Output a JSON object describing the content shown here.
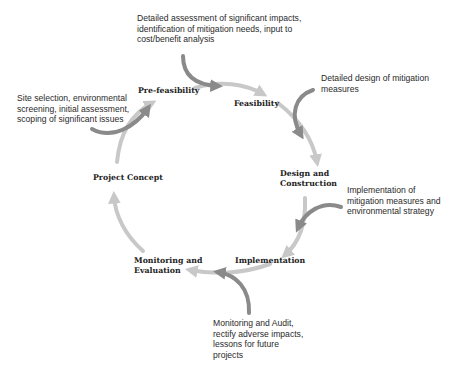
{
  "diagram": {
    "type": "project-cycle",
    "colors": {
      "cycle_arrow": "#c8c8c8",
      "input_arrow": "#8a8a8a",
      "text": "#222222"
    },
    "stages": [
      {
        "id": "pre_feasibility",
        "label": "Pre-feasibility"
      },
      {
        "id": "feasibility",
        "label": "Feasibility"
      },
      {
        "id": "design_construction",
        "label": "Design and\nConstruction"
      },
      {
        "id": "implementation",
        "label": "Implementation"
      },
      {
        "id": "monitoring_evaluation",
        "label": "Monitoring and\nEvaluation"
      },
      {
        "id": "project_concept",
        "label": "Project Concept"
      }
    ],
    "notes": [
      {
        "stage": "pre_feasibility",
        "text": "Site selection, environmental\nscreening, initial assessment,\nscoping of significant issues"
      },
      {
        "stage": "feasibility",
        "text": "Detailed assessment of significant impacts,\nidentification of mitigation needs, input to\ncost/benefit analysis"
      },
      {
        "stage": "design_construction",
        "text": "Detailed design of mitigation\nmeasures"
      },
      {
        "stage": "implementation",
        "text": "Implementation of\nmitigation measures and\nenvironmental strategy"
      },
      {
        "stage": "monitoring_evaluation",
        "text": "Monitoring and Audit,\nrectify adverse impacts,\nlessons for future\nprojects"
      }
    ]
  }
}
